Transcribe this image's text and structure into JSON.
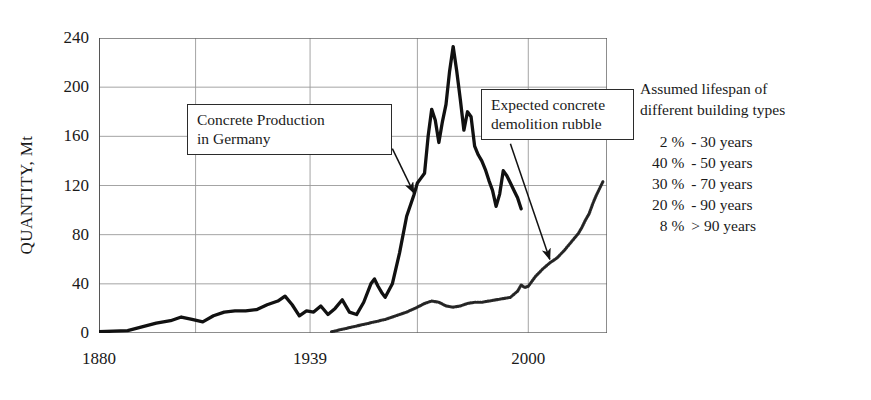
{
  "chart_data": {
    "type": "line",
    "title": "",
    "xlabel": "",
    "ylabel": "QUANTITY, Mt",
    "xlim": [
      1880,
      2022
    ],
    "ylim": [
      0,
      240
    ],
    "yticks": [
      0,
      40,
      80,
      120,
      160,
      200,
      240
    ],
    "xticks": [
      1880,
      1939,
      2000
    ],
    "xtick_labels": [
      "1880",
      "1939",
      "2000"
    ],
    "grid": true,
    "legend_position": "none",
    "series": [
      {
        "name": "Concrete Production in Germany",
        "style": "solid-thick",
        "color": "#111111",
        "points": [
          [
            1880,
            1
          ],
          [
            1884,
            1.5
          ],
          [
            1888,
            2
          ],
          [
            1892,
            5
          ],
          [
            1896,
            8
          ],
          [
            1900,
            10
          ],
          [
            1903,
            13
          ],
          [
            1906,
            11
          ],
          [
            1909,
            9
          ],
          [
            1912,
            14
          ],
          [
            1915,
            17
          ],
          [
            1918,
            18
          ],
          [
            1921,
            18
          ],
          [
            1924,
            19
          ],
          [
            1927,
            23
          ],
          [
            1930,
            26
          ],
          [
            1932,
            30
          ],
          [
            1934,
            23
          ],
          [
            1936,
            14
          ],
          [
            1938,
            18
          ],
          [
            1940,
            17
          ],
          [
            1942,
            22
          ],
          [
            1944,
            15
          ],
          [
            1946,
            20
          ],
          [
            1948,
            27
          ],
          [
            1950,
            17
          ],
          [
            1952,
            15
          ],
          [
            1954,
            25
          ],
          [
            1956,
            40
          ],
          [
            1957,
            44
          ],
          [
            1958,
            38
          ],
          [
            1959,
            33
          ],
          [
            1960,
            29
          ],
          [
            1962,
            40
          ],
          [
            1964,
            65
          ],
          [
            1966,
            95
          ],
          [
            1968,
            112
          ],
          [
            1969,
            122
          ],
          [
            1970,
            126
          ],
          [
            1971,
            130
          ],
          [
            1972,
            160
          ],
          [
            1973,
            182
          ],
          [
            1974,
            173
          ],
          [
            1975,
            155
          ],
          [
            1976,
            172
          ],
          [
            1977,
            186
          ],
          [
            1978,
            213
          ],
          [
            1979,
            233
          ],
          [
            1980,
            213
          ],
          [
            1981,
            190
          ],
          [
            1982,
            165
          ],
          [
            1983,
            180
          ],
          [
            1984,
            176
          ],
          [
            1985,
            152
          ],
          [
            1986,
            145
          ],
          [
            1987,
            140
          ],
          [
            1988,
            133
          ],
          [
            1989,
            124
          ],
          [
            1990,
            116
          ],
          [
            1991,
            103
          ],
          [
            1992,
            113
          ],
          [
            1993,
            132
          ],
          [
            1994,
            128
          ],
          [
            1995,
            122
          ],
          [
            1996,
            116
          ],
          [
            1997,
            110
          ],
          [
            1998,
            101
          ]
        ]
      },
      {
        "name": "Expected concrete demolition rubble",
        "style": "dotted-thin",
        "color": "#222222",
        "points": [
          [
            1945,
            1
          ],
          [
            1948,
            3
          ],
          [
            1951,
            5
          ],
          [
            1954,
            7
          ],
          [
            1957,
            9
          ],
          [
            1960,
            11
          ],
          [
            1963,
            14
          ],
          [
            1966,
            17
          ],
          [
            1969,
            21
          ],
          [
            1971,
            24
          ],
          [
            1973,
            26
          ],
          [
            1975,
            25
          ],
          [
            1977,
            22
          ],
          [
            1979,
            21
          ],
          [
            1981,
            22
          ],
          [
            1983,
            24
          ],
          [
            1985,
            25
          ],
          [
            1987,
            25
          ],
          [
            1989,
            26
          ],
          [
            1991,
            27
          ],
          [
            1993,
            28
          ],
          [
            1995,
            29
          ],
          [
            1997,
            34
          ],
          [
            1998,
            39
          ],
          [
            1999,
            37
          ],
          [
            2000,
            38
          ],
          [
            2002,
            46
          ],
          [
            2004,
            52
          ],
          [
            2006,
            57
          ],
          [
            2008,
            61
          ],
          [
            2010,
            67
          ],
          [
            2012,
            74
          ],
          [
            2014,
            81
          ],
          [
            2015,
            86
          ],
          [
            2016,
            92
          ],
          [
            2017,
            97
          ],
          [
            2018,
            105
          ],
          [
            2019,
            112
          ],
          [
            2020,
            118
          ],
          [
            2021,
            124
          ]
        ]
      }
    ],
    "annotations": [
      {
        "id": "production-callout",
        "lines": [
          "Concrete Production",
          "in Germany"
        ],
        "arrow_from": [
          1962,
          150
        ],
        "arrow_to": [
          1968,
          114
        ]
      },
      {
        "id": "rubble-callout",
        "lines": [
          "Expected  concrete",
          "demolition rubble"
        ],
        "arrow_from": [
          1995,
          154
        ],
        "arrow_to": [
          2006,
          60
        ]
      }
    ]
  },
  "legend_panel": {
    "heading_line1": "Assumed lifespan of",
    "heading_line2": "different  building types",
    "rows": [
      {
        "percent": "2 %",
        "span": "- 30 years"
      },
      {
        "percent": "40 %",
        "span": "- 50 years"
      },
      {
        "percent": "30 %",
        "span": "- 70 years"
      },
      {
        "percent": "20 %",
        "span": "- 90 years"
      },
      {
        "percent": "8 %",
        "span": "> 90 years"
      }
    ]
  },
  "colors": {
    "background": "#ffffff",
    "axis": "#555555",
    "grid": "#9a9a9a",
    "production_line": "#111111",
    "rubble_line": "#222222",
    "callout_border": "#2b2b2b",
    "text": "#1a1a1a"
  }
}
